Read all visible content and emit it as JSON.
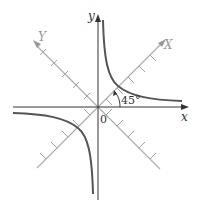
{
  "diagram": {
    "title": "",
    "labels": {
      "x_axis": "x",
      "y_axis": "y",
      "rotated_x_axis": "X",
      "rotated_y_axis": "Y",
      "origin": "0",
      "angle": "45°"
    },
    "colors": {
      "axes": "#222222",
      "rotated_axes": "#aaaaaa",
      "curve": "#555555",
      "labels": "#333333",
      "rotated_labels": "#999999"
    }
  }
}
